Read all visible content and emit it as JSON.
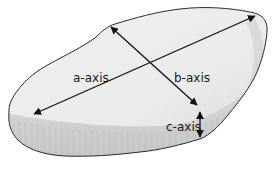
{
  "diagram": {
    "labels": {
      "a_axis": "a-axis",
      "b_axis": "b-axis",
      "c_axis": "c-axis"
    },
    "colors": {
      "fill_top": "#f2f2f2",
      "fill_side": "#c9c9c9",
      "outline": "#2a2a2a",
      "arrow": "#111111"
    }
  }
}
